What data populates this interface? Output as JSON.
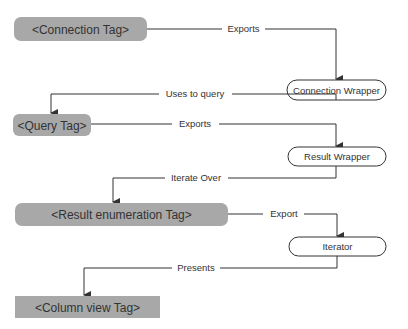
{
  "colors": {
    "tag_fill": "#a8a8a8",
    "line": "#333333",
    "wrapper_fill": "#ffffff"
  },
  "nodes": {
    "connection_tag": "<Connection Tag>",
    "connection_wrapper": "Connection Wrapper",
    "query_tag": "<Query Tag>",
    "result_wrapper": "Result Wrapper",
    "result_enum_tag": "<Result enumeration Tag>",
    "iterator": "Iterator",
    "column_view_tag": "<Column view Tag>"
  },
  "edges": {
    "e1": "Exports",
    "e2": "Uses to query",
    "e3": "Exports",
    "e4": "Iterate Over",
    "e5": "Export",
    "e6": "Presents"
  }
}
